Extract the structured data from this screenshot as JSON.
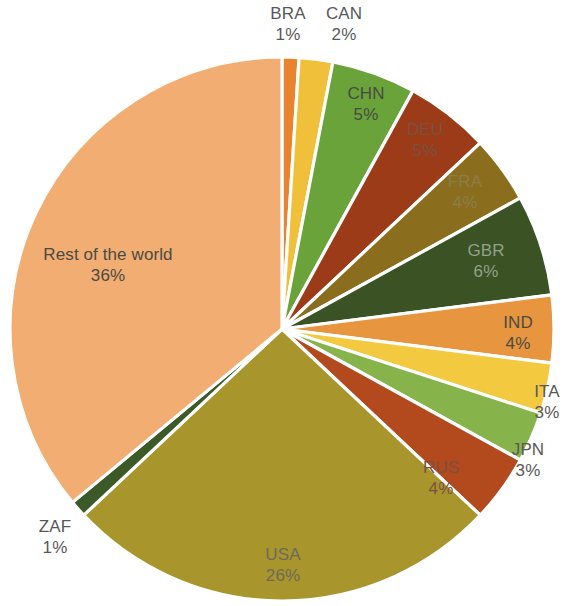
{
  "chart_data": {
    "type": "pie",
    "title": "",
    "subtitle": "",
    "xlabel": "",
    "ylabel": "",
    "legend_position": "none",
    "grid": false,
    "label_format": "name_over_percent",
    "start_angle_deg": 0,
    "direction": "clockwise",
    "categories": [
      "BRA",
      "CAN",
      "CHN",
      "DEU",
      "FRA",
      "GBR",
      "IND",
      "ITA",
      "JPN",
      "RUS",
      "USA",
      "ZAF",
      "Rest of the world"
    ],
    "values": [
      1,
      2,
      5,
      5,
      4,
      6,
      4,
      3,
      3,
      4,
      26,
      1,
      36
    ],
    "value_labels": [
      "1%",
      "2%",
      "5%",
      "5%",
      "4%",
      "6%",
      "4%",
      "3%",
      "3%",
      "4%",
      "26%",
      "1%",
      "36%"
    ],
    "colors": [
      "#e8832e",
      "#f1c03a",
      "#6aa339",
      "#9c3b18",
      "#8b6d1e",
      "#3a5224",
      "#e8953f",
      "#f3ca3f",
      "#86b44a",
      "#b24a1e",
      "#a8952c",
      "#3c5a27",
      "#f2ad72"
    ],
    "slices": [
      {
        "name": "BRA",
        "value": 1,
        "value_label": "1%",
        "color": "#e8832e",
        "label_placement": "outside",
        "label_x": 288,
        "label_y": 25
      },
      {
        "name": "CAN",
        "value": 2,
        "value_label": "2%",
        "color": "#f1c03a",
        "label_placement": "outside",
        "label_x": 344,
        "label_y": 25
      },
      {
        "name": "CHN",
        "value": 5,
        "value_label": "5%",
        "color": "#6aa339",
        "label_placement": "inside",
        "label_tone": "dark",
        "label_x": 366,
        "label_y": 105
      },
      {
        "name": "DEU",
        "value": 5,
        "value_label": "5%",
        "color": "#9c3b18",
        "label_placement": "inside",
        "label_tone": "on-red",
        "label_x": 425,
        "label_y": 141
      },
      {
        "name": "FRA",
        "value": 4,
        "value_label": "4%",
        "color": "#8b6d1e",
        "label_placement": "inside",
        "label_tone": "on-olive",
        "label_x": 465,
        "label_y": 193
      },
      {
        "name": "GBR",
        "value": 6,
        "value_label": "6%",
        "color": "#3a5224",
        "label_placement": "inside",
        "label_tone": "on-green",
        "label_x": 486,
        "label_y": 262
      },
      {
        "name": "IND",
        "value": 4,
        "value_label": "4%",
        "color": "#e8953f",
        "label_placement": "inside",
        "label_tone": "dark",
        "label_x": 518,
        "label_y": 334
      },
      {
        "name": "ITA",
        "value": 3,
        "value_label": "3%",
        "color": "#f3ca3f",
        "label_placement": "outside",
        "label_x": 547,
        "label_y": 403
      },
      {
        "name": "JPN",
        "value": 3,
        "value_label": "3%",
        "color": "#86b44a",
        "label_placement": "outside",
        "label_x": 528,
        "label_y": 461
      },
      {
        "name": "RUS",
        "value": 4,
        "value_label": "4%",
        "color": "#b24a1e",
        "label_placement": "inside",
        "label_tone": "on-red",
        "label_x": 441,
        "label_y": 479
      },
      {
        "name": "USA",
        "value": 26,
        "value_label": "26%",
        "color": "#a8952c",
        "label_placement": "inside",
        "label_tone": "light",
        "label_x": 283,
        "label_y": 566
      },
      {
        "name": "ZAF",
        "value": 1,
        "value_label": "1%",
        "color": "#3c5a27",
        "label_placement": "outside",
        "label_x": 55,
        "label_y": 538
      },
      {
        "name": "Rest of the world",
        "value": 36,
        "value_label": "36%",
        "color": "#f2ad72",
        "label_placement": "inside",
        "label_tone": "dark",
        "label_x": 108,
        "label_y": 266
      }
    ],
    "geometry": {
      "center_x": 282,
      "center_y": 329,
      "radius": 272,
      "gap_degrees": 0.9
    },
    "background_color": "#ffffff"
  }
}
